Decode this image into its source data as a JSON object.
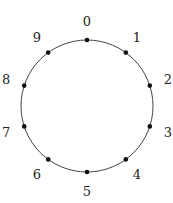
{
  "diagram": {
    "type": "cycle",
    "node_count": 10,
    "nodes": [
      {
        "id": 0,
        "label": "0"
      },
      {
        "id": 1,
        "label": "1"
      },
      {
        "id": 2,
        "label": "2"
      },
      {
        "id": 3,
        "label": "3"
      },
      {
        "id": 4,
        "label": "4"
      },
      {
        "id": 5,
        "label": "5"
      },
      {
        "id": 6,
        "label": "6"
      },
      {
        "id": 7,
        "label": "7"
      },
      {
        "id": 8,
        "label": "8"
      },
      {
        "id": 9,
        "label": "9"
      }
    ],
    "colors": {
      "circle": "#444444",
      "node": "#111111",
      "label": "#222222",
      "background": "#ffffff"
    }
  }
}
